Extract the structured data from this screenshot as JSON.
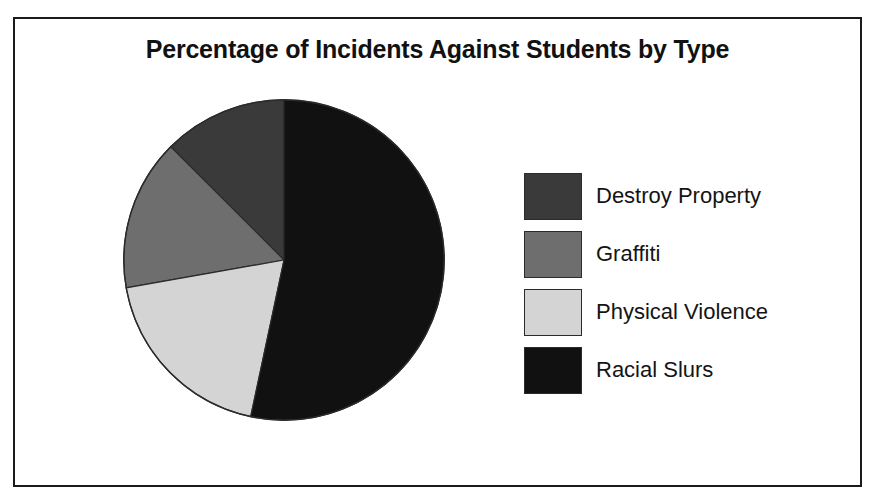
{
  "chart": {
    "title": "Percentage of Incidents Against Students by Type"
  },
  "chart_data": {
    "type": "pie",
    "title": "Percentage of Incidents Against Students by Type",
    "xlabel": "",
    "ylabel": "",
    "legend_position": "right",
    "grid": false,
    "start_angle_deg": 0,
    "direction": "clockwise",
    "categories": [
      "Destroy Property",
      "Graffiti",
      "Physical Violence",
      "Racial Slurs"
    ],
    "values": [
      13,
      15,
      19,
      53
    ],
    "unit": "percent",
    "slices": [
      {
        "label": "Destroy Property",
        "value": 13,
        "angle_deg": 45,
        "start_deg": 315,
        "end_deg": 360,
        "color": "#3a3a3a"
      },
      {
        "label": "Graffiti",
        "value": 15,
        "angle_deg": 55,
        "start_deg": 260,
        "end_deg": 315,
        "color": "#6e6e6e"
      },
      {
        "label": "Physical Violence",
        "value": 19,
        "angle_deg": 68,
        "start_deg": 192,
        "end_deg": 260,
        "color": "#d4d4d4"
      },
      {
        "label": "Racial Slurs",
        "value": 53,
        "angle_deg": 192,
        "start_deg": 0,
        "end_deg": 192,
        "color": "#111111"
      }
    ]
  },
  "legend": {
    "items": [
      {
        "label": "Destroy Property",
        "color": "#3a3a3a"
      },
      {
        "label": "Graffiti",
        "color": "#6e6e6e"
      },
      {
        "label": "Physical Violence",
        "color": "#d4d4d4"
      },
      {
        "label": "Racial Slurs",
        "color": "#111111"
      }
    ]
  }
}
